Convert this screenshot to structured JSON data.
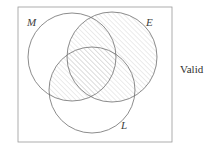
{
  "figure": {
    "kind": "venn-diagram-three-set",
    "caption_right": "Valid",
    "outer_box": {
      "name": "universe-rectangle",
      "x": 18,
      "y": 7,
      "width": 154,
      "height": 135,
      "stroke": "#9a9a9a",
      "stroke_width": 0.8,
      "fill": "none"
    },
    "circles": [
      {
        "id": "M",
        "label": "M",
        "cx": 72,
        "cy": 57,
        "r": 44,
        "stroke": "#6f6f6f",
        "stroke_width": 0.8,
        "label_x": 27,
        "label_y": 17
      },
      {
        "id": "E",
        "label": "E",
        "cx": 112,
        "cy": 57,
        "r": 45,
        "stroke": "#6f6f6f",
        "stroke_width": 0.8,
        "label_x": 146,
        "label_y": 17
      },
      {
        "id": "L",
        "label": "L",
        "cx": 92,
        "cy": 90,
        "r": 43,
        "stroke": "#6f6f6f",
        "stroke_width": 0.8,
        "label_x": 121,
        "label_y": 120
      }
    ],
    "shading": {
      "style": "diagonal-hatch",
      "direction": "forward-slash",
      "spacing_px": 3.5,
      "line_color": "#b9b9b9",
      "line_width": 0.55,
      "shaded_regions": [
        {
          "name": "E-circle-shaded",
          "description": "entire E circle interior hatched"
        },
        {
          "name": "M-intersect-L-shaded",
          "description": "intersection of M and L circles hatched"
        }
      ],
      "unshaded_regions": [
        {
          "name": "M-only",
          "description": "M circle outside E and outside L is blank"
        },
        {
          "name": "L-only",
          "description": "L circle outside M and outside E is blank"
        },
        {
          "name": "outside-all",
          "description": "rectangle area outside all three circles is blank"
        }
      ]
    },
    "labels": {
      "M": "M",
      "E": "E",
      "L": "L"
    }
  }
}
